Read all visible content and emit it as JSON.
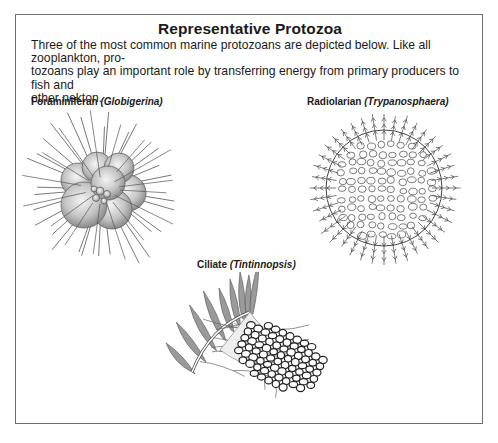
{
  "figure": {
    "title": "Representative Protozoa",
    "intro": "Three of the most common marine protozoans are depicted below. Like all zooplankton, protozoans play an important role by transferring energy from primary producers to fish and other nekton.",
    "intro_lines": [
      "Three of the most common marine protozoans are depicted below. Like all zooplankton, pro-",
      "tozoans play an important role by transferring energy from primary producers to fish and",
      "other nekton."
    ],
    "organisms": [
      {
        "common_name": "Foraminiferan",
        "genus": "(Globigerina)",
        "illustration": "spiny-globular-chambered-shell"
      },
      {
        "common_name": "Radiolarian",
        "genus": "(Trypanosphaera)",
        "illustration": "lattice-sphere-with-barbed-spines"
      },
      {
        "common_name": "Ciliate",
        "genus": "(Tintinnopsis)",
        "illustration": "cilia-crown-with-agglutinated-lorica"
      }
    ]
  },
  "colors": {
    "frame_border": "#6e6e6e",
    "ink": "#1a1a1a",
    "shell_gray": "#bdbdbd"
  }
}
